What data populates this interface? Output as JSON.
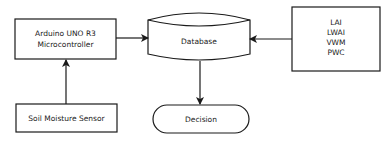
{
  "diagram": {
    "nodes": {
      "arduino": {
        "lines": [
          "Arduino UNO R3",
          "Microcontroller"
        ],
        "shape": "rectangle"
      },
      "soil_sensor": {
        "label": "Soil Moisture Sensor",
        "shape": "rectangle"
      },
      "database": {
        "label": "Database",
        "shape": "stored-data"
      },
      "indices": {
        "lines": [
          "LAI",
          "LWAI",
          "VWM",
          "PWC"
        ],
        "shape": "rectangle"
      },
      "decision": {
        "label": "Decision",
        "shape": "terminator"
      }
    },
    "edges": [
      {
        "from": "soil_sensor",
        "to": "arduino"
      },
      {
        "from": "arduino",
        "to": "database"
      },
      {
        "from": "indices",
        "to": "database"
      },
      {
        "from": "database",
        "to": "decision"
      }
    ],
    "colors": {
      "stroke": "#1a1a1a",
      "fill": "#ffffff"
    }
  }
}
